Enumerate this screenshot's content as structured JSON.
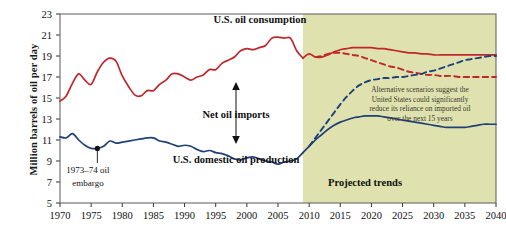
{
  "chart_data": {
    "type": "line",
    "title": "",
    "xlabel": "",
    "ylabel": "Million barrels of oil per day",
    "xlim": [
      1970,
      2040
    ],
    "ylim": [
      5,
      23
    ],
    "yticks": [
      5,
      7,
      9,
      11,
      13,
      15,
      17,
      19,
      21,
      23
    ],
    "xticks": [
      1970,
      1975,
      1980,
      1985,
      1990,
      1995,
      2000,
      2005,
      2010,
      2015,
      2020,
      2025,
      2030,
      2035,
      2040
    ],
    "grid": false,
    "legend_position": "inline-annotations",
    "projection_start_year": 2009,
    "shaded_region_color": "#dfe2ae",
    "series": [
      {
        "name": "U.S. oil consumption",
        "style": "solid",
        "color": "#c0272d",
        "x": [
          1970,
          1971,
          1972,
          1973,
          1974,
          1975,
          1976,
          1977,
          1978,
          1979,
          1980,
          1981,
          1982,
          1983,
          1984,
          1985,
          1986,
          1987,
          1988,
          1989,
          1990,
          1991,
          1992,
          1993,
          1994,
          1995,
          1996,
          1997,
          1998,
          1999,
          2000,
          2001,
          2002,
          2003,
          2004,
          2005,
          2006,
          2007,
          2008,
          2009
        ],
        "y": [
          14.7,
          15.2,
          16.4,
          17.3,
          16.7,
          16.3,
          17.5,
          18.4,
          18.8,
          18.5,
          17.1,
          16.1,
          15.3,
          15.2,
          15.7,
          15.7,
          16.3,
          16.7,
          17.3,
          17.3,
          17.0,
          16.7,
          17.0,
          17.2,
          17.7,
          17.7,
          18.3,
          18.6,
          18.9,
          19.5,
          19.7,
          19.6,
          19.8,
          20.0,
          20.7,
          20.8,
          20.7,
          20.7,
          19.5,
          18.8
        ]
      },
      {
        "name": "U.S. oil consumption (projected reference)",
        "style": "solid",
        "color": "#c0272d",
        "x": [
          2009,
          2010,
          2011,
          2012,
          2013,
          2014,
          2015,
          2016,
          2017,
          2018,
          2019,
          2020,
          2021,
          2022,
          2023,
          2024,
          2025,
          2026,
          2027,
          2028,
          2029,
          2030,
          2031,
          2032,
          2033,
          2034,
          2035,
          2036,
          2037,
          2038,
          2039,
          2040
        ],
        "y": [
          18.8,
          19.2,
          18.9,
          18.9,
          19.1,
          19.4,
          19.6,
          19.7,
          19.8,
          19.8,
          19.8,
          19.8,
          19.7,
          19.7,
          19.6,
          19.5,
          19.4,
          19.3,
          19.3,
          19.2,
          19.2,
          19.1,
          19.1,
          19.1,
          19.1,
          19.1,
          19.1,
          19.1,
          19.1,
          19.1,
          19.1,
          19.1
        ]
      },
      {
        "name": "U.S. oil consumption (alternative scenario)",
        "style": "dashed",
        "color": "#c0272d",
        "x": [
          2011,
          2012,
          2013,
          2014,
          2015,
          2016,
          2017,
          2018,
          2019,
          2020,
          2021,
          2022,
          2023,
          2024,
          2025,
          2026,
          2027,
          2028,
          2029,
          2030,
          2031,
          2032,
          2033,
          2034,
          2035,
          2036,
          2037,
          2038,
          2039,
          2040
        ],
        "y": [
          18.9,
          19.0,
          19.2,
          19.3,
          19.3,
          19.2,
          19.1,
          19.0,
          18.8,
          18.6,
          18.4,
          18.2,
          18.0,
          17.9,
          17.7,
          17.5,
          17.4,
          17.3,
          17.2,
          17.2,
          17.1,
          17.1,
          17.1,
          17.0,
          17.0,
          17.0,
          17.0,
          17.0,
          17.0,
          17.0
        ]
      },
      {
        "name": "U.S. domestic oil production",
        "style": "solid",
        "color": "#1f3f7a",
        "x": [
          1970,
          1971,
          1972,
          1973,
          1974,
          1975,
          1976,
          1977,
          1978,
          1979,
          1980,
          1981,
          1982,
          1983,
          1984,
          1985,
          1986,
          1987,
          1988,
          1989,
          1990,
          1991,
          1992,
          1993,
          1994,
          1995,
          1996,
          1997,
          1998,
          1999,
          2000,
          2001,
          2002,
          2003,
          2004,
          2005,
          2006,
          2007,
          2008,
          2009
        ],
        "y": [
          11.3,
          11.2,
          11.6,
          11.0,
          10.5,
          10.2,
          10.2,
          10.4,
          10.9,
          10.7,
          10.8,
          10.9,
          11.0,
          11.1,
          11.2,
          11.2,
          10.9,
          10.8,
          10.6,
          10.4,
          10.5,
          10.4,
          10.1,
          9.9,
          10.0,
          9.8,
          9.7,
          9.5,
          9.2,
          9.1,
          9.3,
          9.4,
          9.2,
          9.0,
          8.9,
          8.7,
          8.9,
          9.0,
          9.2,
          9.8
        ]
      },
      {
        "name": "U.S. domestic oil production (projected reference)",
        "style": "solid",
        "color": "#1f3f7a",
        "x": [
          2009,
          2010,
          2011,
          2012,
          2013,
          2014,
          2015,
          2016,
          2017,
          2018,
          2019,
          2020,
          2021,
          2022,
          2023,
          2024,
          2025,
          2026,
          2027,
          2028,
          2029,
          2030,
          2031,
          2032,
          2033,
          2034,
          2035,
          2036,
          2037,
          2038,
          2039,
          2040
        ],
        "y": [
          9.8,
          10.4,
          11.0,
          11.5,
          12.0,
          12.4,
          12.7,
          12.9,
          13.1,
          13.2,
          13.3,
          13.3,
          13.3,
          13.2,
          13.1,
          13.0,
          12.9,
          12.8,
          12.7,
          12.6,
          12.5,
          12.4,
          12.3,
          12.2,
          12.2,
          12.2,
          12.2,
          12.3,
          12.4,
          12.5,
          12.5,
          12.5
        ]
      },
      {
        "name": "U.S. domestic oil production (alternative scenario)",
        "style": "dashed",
        "color": "#1f3f7a",
        "x": [
          2010,
          2011,
          2012,
          2013,
          2014,
          2015,
          2016,
          2017,
          2018,
          2019,
          2020,
          2021,
          2022,
          2023,
          2024,
          2025,
          2026,
          2027,
          2028,
          2029,
          2030,
          2031,
          2032,
          2033,
          2034,
          2035,
          2036,
          2037,
          2038,
          2039,
          2040
        ],
        "y": [
          10.4,
          11.2,
          12.0,
          12.8,
          13.6,
          14.4,
          15.1,
          15.7,
          16.2,
          16.5,
          16.7,
          16.8,
          16.9,
          16.9,
          17.0,
          17.0,
          17.1,
          17.2,
          17.3,
          17.5,
          17.6,
          17.8,
          18.0,
          18.2,
          18.4,
          18.6,
          18.7,
          18.8,
          18.9,
          19.0,
          19.0
        ]
      }
    ],
    "annotations": {
      "consumption_label": "U.S. oil consumption",
      "production_label": "U.S. domestic oil production",
      "net_imports_label": "Net oil imports",
      "projected_label": "Projected trends",
      "embargo_label_line1": "1973–74 oil",
      "embargo_label_line2": "embargo",
      "embargo_marker_year": 1976,
      "embargo_marker_value": 10.2,
      "scenario_note_lines": [
        "Alternative scenarios suggest the",
        "United States could significantly",
        "reduce its reliance on imported oil",
        "over the next 15 years"
      ]
    }
  }
}
